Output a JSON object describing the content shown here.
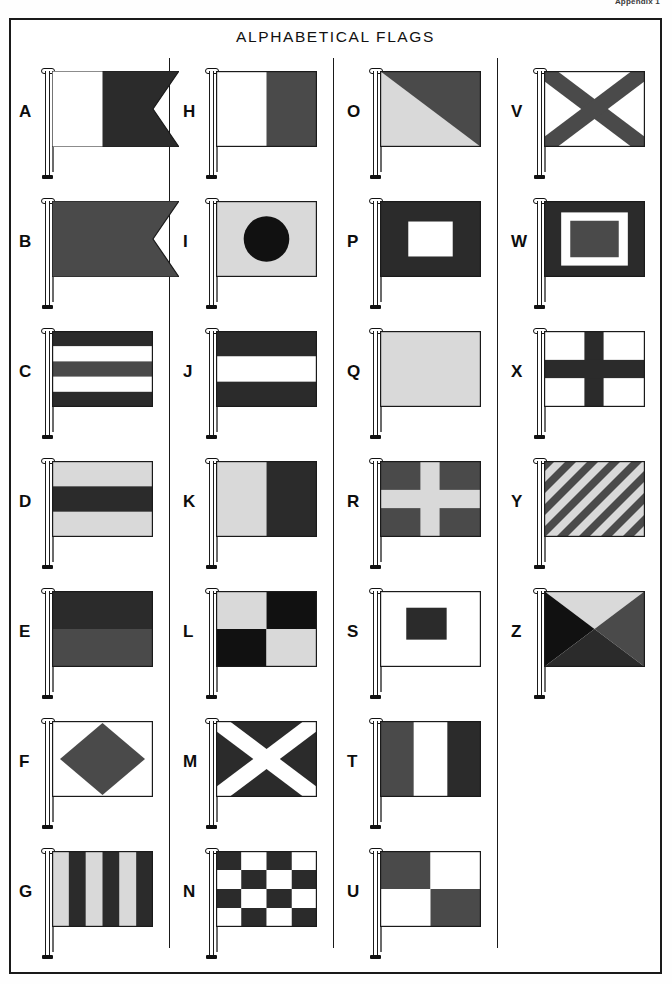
{
  "page": {
    "corner_label": "Appendix 1",
    "title": "ALPHABETICAL FLAGS"
  },
  "palette": {
    "red": "#4a4a4a",
    "blue": "#2b2b2b",
    "yellow": "#d9d9d9",
    "white": "#ffffff",
    "black": "#111111",
    "outline": "#1a1a1a"
  },
  "columns": [
    {
      "index": 1,
      "flags": [
        {
          "letter": "A",
          "name": "flag-alfa",
          "shape": "swallowtail",
          "pattern": "vertical-half-swallowtail",
          "colors": [
            "white",
            "blue"
          ]
        },
        {
          "letter": "B",
          "name": "flag-bravo",
          "shape": "swallowtail",
          "pattern": "solid-swallowtail",
          "colors": [
            "red"
          ]
        },
        {
          "letter": "C",
          "name": "flag-charlie",
          "shape": "rect",
          "pattern": "horizontal-stripes-5",
          "colors": [
            "blue",
            "white",
            "red",
            "white",
            "blue"
          ]
        },
        {
          "letter": "D",
          "name": "flag-delta",
          "shape": "rect",
          "pattern": "horizontal-stripes-3",
          "colors": [
            "yellow",
            "blue",
            "yellow"
          ]
        },
        {
          "letter": "E",
          "name": "flag-echo",
          "shape": "rect",
          "pattern": "horizontal-stripes-2",
          "colors": [
            "blue",
            "red"
          ]
        },
        {
          "letter": "F",
          "name": "flag-foxtrot",
          "shape": "rect",
          "pattern": "diamond",
          "colors": [
            "white",
            "red"
          ]
        },
        {
          "letter": "G",
          "name": "flag-golf",
          "shape": "rect",
          "pattern": "vertical-stripes-6",
          "colors": [
            "yellow",
            "blue",
            "yellow",
            "blue",
            "yellow",
            "blue"
          ]
        }
      ]
    },
    {
      "index": 2,
      "flags": [
        {
          "letter": "H",
          "name": "flag-hotel",
          "shape": "rect",
          "pattern": "vertical-halves",
          "colors": [
            "white",
            "red"
          ]
        },
        {
          "letter": "I",
          "name": "flag-india",
          "shape": "rect",
          "pattern": "circle",
          "colors": [
            "yellow",
            "black"
          ]
        },
        {
          "letter": "J",
          "name": "flag-juliett",
          "shape": "rect",
          "pattern": "horizontal-stripes-3",
          "colors": [
            "blue",
            "white",
            "blue"
          ]
        },
        {
          "letter": "K",
          "name": "flag-kilo",
          "shape": "rect",
          "pattern": "vertical-halves",
          "colors": [
            "yellow",
            "blue"
          ]
        },
        {
          "letter": "L",
          "name": "flag-lima",
          "shape": "rect",
          "pattern": "quarters",
          "colors": [
            "yellow",
            "black",
            "black",
            "yellow"
          ]
        },
        {
          "letter": "M",
          "name": "flag-mike",
          "shape": "rect",
          "pattern": "saltire",
          "colors": [
            "blue",
            "white"
          ]
        },
        {
          "letter": "N",
          "name": "flag-november",
          "shape": "rect",
          "pattern": "checker-4x4",
          "colors": [
            "blue",
            "white"
          ]
        }
      ]
    },
    {
      "index": 3,
      "flags": [
        {
          "letter": "O",
          "name": "flag-oscar",
          "shape": "rect",
          "pattern": "diagonal-halves",
          "colors": [
            "red",
            "yellow"
          ]
        },
        {
          "letter": "P",
          "name": "flag-papa",
          "shape": "rect",
          "pattern": "rect-center-large",
          "colors": [
            "blue",
            "white"
          ]
        },
        {
          "letter": "Q",
          "name": "flag-quebec",
          "shape": "rect",
          "pattern": "solid",
          "colors": [
            "yellow"
          ]
        },
        {
          "letter": "R",
          "name": "flag-romeo",
          "shape": "rect",
          "pattern": "cross",
          "colors": [
            "red",
            "yellow"
          ]
        },
        {
          "letter": "S",
          "name": "flag-sierra",
          "shape": "rect",
          "pattern": "rect-center-small",
          "colors": [
            "white",
            "blue"
          ]
        },
        {
          "letter": "T",
          "name": "flag-tango",
          "shape": "rect",
          "pattern": "vertical-stripes-3",
          "colors": [
            "red",
            "white",
            "blue"
          ]
        },
        {
          "letter": "U",
          "name": "flag-uniform",
          "shape": "rect",
          "pattern": "quarters",
          "colors": [
            "red",
            "white",
            "white",
            "red"
          ]
        }
      ]
    },
    {
      "index": 4,
      "flags": [
        {
          "letter": "V",
          "name": "flag-victor",
          "shape": "rect",
          "pattern": "saltire",
          "colors": [
            "white",
            "red"
          ]
        },
        {
          "letter": "W",
          "name": "flag-whiskey",
          "shape": "rect",
          "pattern": "nested-rect",
          "colors": [
            "blue",
            "white",
            "red"
          ]
        },
        {
          "letter": "X",
          "name": "flag-xray",
          "shape": "rect",
          "pattern": "cross",
          "colors": [
            "white",
            "blue"
          ]
        },
        {
          "letter": "Y",
          "name": "flag-yankee",
          "shape": "rect",
          "pattern": "diagonal-stripes",
          "colors": [
            "yellow",
            "red"
          ]
        },
        {
          "letter": "Z",
          "name": "flag-zulu",
          "shape": "rect",
          "pattern": "quadrant-triangles",
          "colors": [
            "yellow",
            "black",
            "red",
            "blue"
          ]
        }
      ]
    }
  ]
}
